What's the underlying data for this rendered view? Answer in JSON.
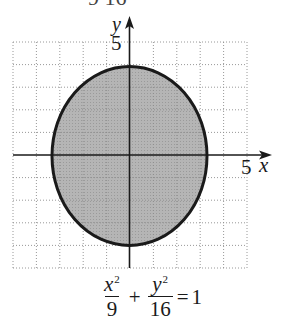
{
  "cropped_top_text": "9        16",
  "graph": {
    "x_axis_label": "x",
    "y_axis_label": "y",
    "x_tick_label": "5",
    "y_tick_label": "5",
    "x_range": [
      -5,
      5
    ],
    "y_range": [
      -5,
      5
    ],
    "grid": "dotted, 1-unit spacing",
    "ellipse": {
      "a": 3,
      "b": 4,
      "center": [
        0,
        0
      ],
      "fill": "#b3b3b3",
      "stroke": "#1a1a1a"
    }
  },
  "equation": {
    "term1_numerator": "x",
    "term1_exponent": "2",
    "term1_denominator": "9",
    "plus": "+",
    "term2_numerator": "y",
    "term2_exponent": "2",
    "term2_denominator": "16",
    "equals": "=",
    "rhs": "1"
  }
}
